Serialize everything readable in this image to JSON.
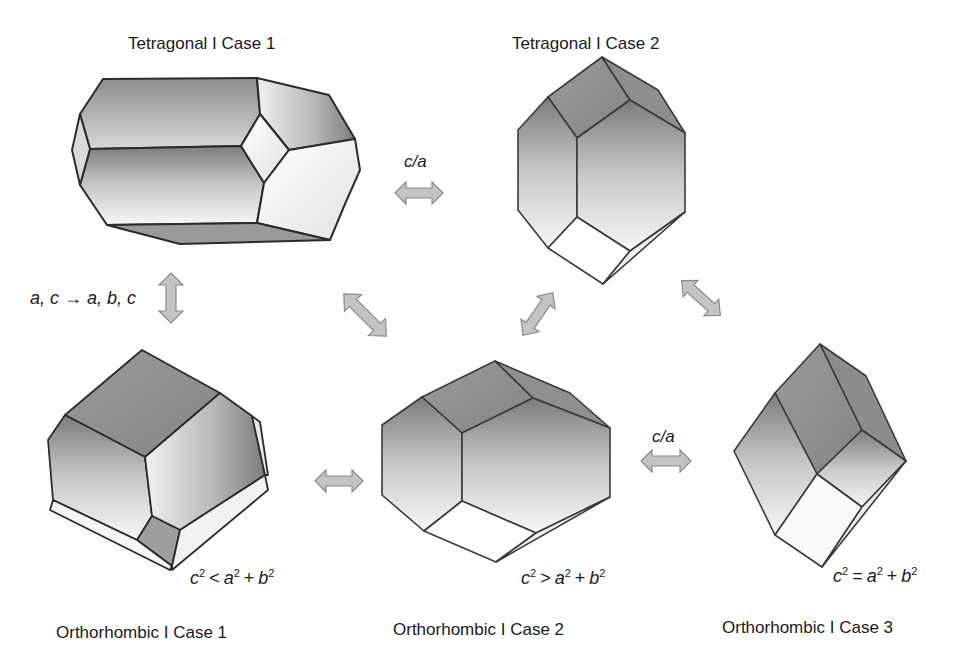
{
  "figure": {
    "crystals": [
      {
        "id": "tetragonal-1",
        "title": "Tetragonal I Case 1"
      },
      {
        "id": "tetragonal-2",
        "title": "Tetragonal I Case 2"
      },
      {
        "id": "orthorhombic-1",
        "title": "Orthorhombic I Case 1",
        "condition": {
          "lhs": "c",
          "op": "<",
          "a": "a",
          "b": "b",
          "exp": "2",
          "plus": "+"
        }
      },
      {
        "id": "orthorhombic-2",
        "title": "Orthorhombic I Case 2",
        "condition": {
          "lhs": "c",
          "op": ">",
          "a": "a",
          "b": "b",
          "exp": "2",
          "plus": "+"
        }
      },
      {
        "id": "orthorhombic-3",
        "title": "Orthorhombic I Case 3",
        "condition": {
          "lhs": "c",
          "op": "=",
          "a": "a",
          "b": "b",
          "exp": "2",
          "plus": "+"
        }
      }
    ],
    "transitions": {
      "tetragonal_ratio": "c/a",
      "orthorhombic_ratio": "c/a",
      "lattice_change": "a, c → a, b, c"
    },
    "colors": {
      "arrow_fill": "#c4c4c4",
      "arrow_stroke": "#8a8a8a",
      "edge": "#2b2b2b",
      "face_dark": "#8f8f8f",
      "face_light": "#f4f4f4"
    }
  }
}
